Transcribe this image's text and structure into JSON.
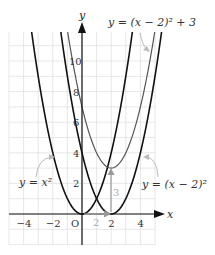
{
  "chart_data": {
    "type": "line",
    "title": "",
    "xlabel": "x",
    "ylabel": "y",
    "xlim": [
      -5,
      5
    ],
    "ylim": [
      -2,
      12
    ],
    "grid": true,
    "x_ticks": [
      {
        "value": -4,
        "label": "−4"
      },
      {
        "value": -2,
        "label": "−2"
      },
      {
        "value": 0,
        "label": "O"
      },
      {
        "value": 2,
        "label": "2"
      },
      {
        "value": 4,
        "label": "4"
      }
    ],
    "y_ticks": [
      {
        "value": 2,
        "label": "2"
      },
      {
        "value": 4,
        "label": "4"
      },
      {
        "value": 6,
        "label": "6"
      },
      {
        "value": 8,
        "label": "8"
      },
      {
        "value": 10,
        "label": "10"
      }
    ],
    "series": [
      {
        "name": "y = x²",
        "formula": "x^2",
        "h": 0,
        "k": 0,
        "color": "#111111",
        "width": 1.6
      },
      {
        "name": "y = (x − 2)²",
        "formula": "(x-2)^2",
        "h": 2,
        "k": 0,
        "color": "#111111",
        "width": 1.6
      },
      {
        "name": "y = (x − 2)² + 3",
        "formula": "(x-2)^2+3",
        "h": 2,
        "k": 3,
        "color": "#555555",
        "width": 1.2
      }
    ],
    "annotations": [
      {
        "text": "2",
        "type": "horizontal-shift",
        "from": [
          0,
          0
        ],
        "to": [
          2,
          0
        ],
        "color": "#999999"
      },
      {
        "text": "3",
        "type": "vertical-shift",
        "from": [
          2,
          0
        ],
        "to": [
          2,
          3
        ],
        "color": "#999999"
      }
    ],
    "labels": {
      "y_axis": "y",
      "x_axis": "x",
      "eq_top": "y = (x − 2)² + 3",
      "eq_left": "y = x²",
      "eq_right": "y = (x − 2)²",
      "shift_x": "2",
      "shift_y": "3"
    }
  }
}
